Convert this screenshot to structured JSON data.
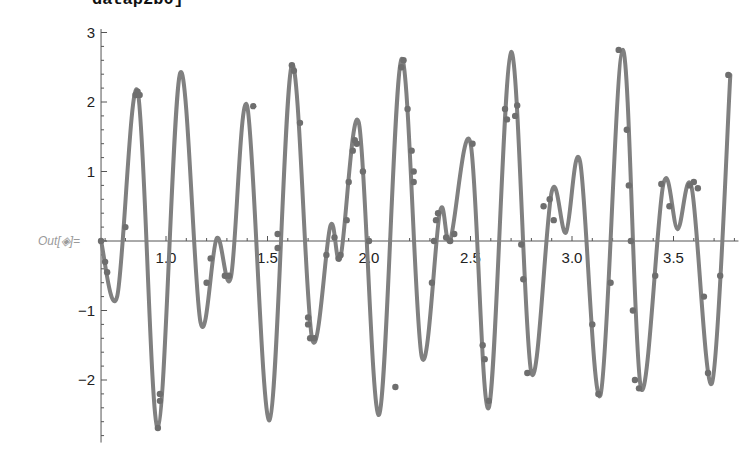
{
  "notebook": {
    "input_fragment": "datap2b0]",
    "output_label": "Out[◈]="
  },
  "style": {
    "curve_color": "#808080",
    "point_color": "#6e6e6e",
    "axis_color": "#555555"
  },
  "chart_data": {
    "type": "line",
    "title": "",
    "xlabel": "",
    "ylabel": "",
    "xlim": [
      0.68,
      3.82
    ],
    "ylim": [
      -2.9,
      3.05
    ],
    "grid": false,
    "legend": null,
    "x_ticks": [
      "1.0",
      "1.5",
      "2.0",
      "2.5",
      "3.0",
      "3.5"
    ],
    "y_ticks": [
      "3",
      "2",
      "1",
      "-1",
      "-2"
    ],
    "series": [
      {
        "name": "curve (with sampled points overlay)",
        "x": [
          0.68,
          0.76,
          0.86,
          0.96,
          1.07,
          1.17,
          1.25,
          1.32,
          1.4,
          1.51,
          1.62,
          1.72,
          1.81,
          1.86,
          1.95,
          2.05,
          2.16,
          2.26,
          2.35,
          2.4,
          2.5,
          2.59,
          2.7,
          2.8,
          2.9,
          2.97,
          3.04,
          3.14,
          3.25,
          3.34,
          3.45,
          3.52,
          3.59,
          3.69,
          3.78
        ],
        "y": [
          0.0,
          -0.79,
          2.16,
          -2.69,
          2.42,
          -1.17,
          0.04,
          -0.52,
          1.94,
          -2.58,
          2.53,
          -1.41,
          0.22,
          -0.23,
          1.7,
          -2.5,
          2.62,
          -1.67,
          0.43,
          0.01,
          1.41,
          -2.4,
          2.72,
          -1.9,
          0.71,
          0.12,
          1.14,
          -2.22,
          2.75,
          -2.12,
          0.82,
          0.17,
          0.76,
          -2.04,
          2.39
        ]
      }
    ],
    "sample_points": {
      "description": "Dark dots placed along the curve; dense clusters near x≈2.32, 3.28, 3.62",
      "x": [
        0.68,
        0.7,
        0.71,
        0.8,
        0.85,
        0.86,
        0.87,
        0.96,
        0.97,
        0.97,
        1.2,
        1.22,
        1.29,
        1.31,
        1.43,
        1.55,
        1.55,
        1.62,
        1.63,
        1.66,
        1.7,
        1.7,
        1.71,
        1.73,
        1.79,
        1.83,
        1.85,
        1.86,
        1.89,
        1.9,
        1.92,
        1.93,
        1.94,
        1.97,
        2.0,
        2.13,
        2.16,
        2.17,
        2.19,
        2.21,
        2.22,
        2.22,
        2.31,
        2.32,
        2.33,
        2.34,
        2.38,
        2.4,
        2.42,
        2.51,
        2.56,
        2.57,
        2.59,
        2.67,
        2.68,
        2.72,
        2.73,
        2.75,
        2.76,
        2.78,
        2.86,
        2.89,
        2.91,
        3.1,
        3.13,
        3.19,
        3.23,
        3.27,
        3.28,
        3.29,
        3.3,
        3.31,
        3.33,
        3.41,
        3.44,
        3.48,
        3.58,
        3.6,
        3.62,
        3.65,
        3.67,
        3.73,
        3.77
      ],
      "y": [
        0.0,
        -0.3,
        -0.45,
        0.2,
        2.1,
        2.15,
        2.1,
        -2.69,
        -2.3,
        -2.2,
        -0.6,
        -0.25,
        -0.5,
        -0.5,
        1.94,
        0.1,
        -0.1,
        2.53,
        2.45,
        1.7,
        -1.1,
        -1.2,
        -1.4,
        -1.4,
        -0.2,
        0.05,
        -0.25,
        -0.2,
        0.3,
        0.85,
        1.3,
        1.45,
        1.4,
        1.0,
        0.0,
        -2.1,
        2.5,
        2.6,
        1.9,
        1.3,
        1.0,
        0.85,
        -0.6,
        0.0,
        0.3,
        0.4,
        0.05,
        0.0,
        0.1,
        1.4,
        -1.5,
        -1.7,
        -2.3,
        1.9,
        1.75,
        1.8,
        1.95,
        -0.05,
        -0.55,
        -1.9,
        0.5,
        0.6,
        0.3,
        -1.2,
        -2.2,
        -0.6,
        2.75,
        1.6,
        0.8,
        0.0,
        -1.0,
        -2.0,
        -2.12,
        -0.5,
        0.82,
        0.5,
        0.8,
        0.85,
        0.76,
        -0.8,
        -1.9,
        -0.5,
        2.39
      ]
    }
  }
}
